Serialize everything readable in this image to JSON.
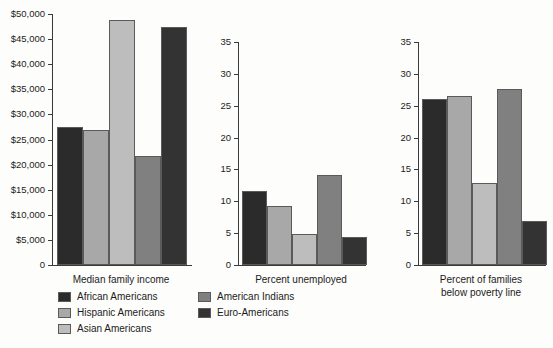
{
  "chart_data": {
    "type": "bar",
    "title": "",
    "grid": false,
    "legend_position": "bottom-left",
    "categories": [
      "African Americans",
      "Hispanic Americans",
      "Asian Americans",
      "American Indians",
      "Euro-Americans"
    ],
    "series_colors": [
      "#2b2b2b",
      "#a8a8a8",
      "#bdbdbd",
      "#808080",
      "#333333"
    ],
    "panels": [
      {
        "id": "median-family-income",
        "xlabel": "Median family income",
        "ylabel": "",
        "ylim": [
          0,
          50000
        ],
        "ytick_values": [
          0,
          5000,
          10000,
          15000,
          20000,
          25000,
          30000,
          35000,
          40000,
          45000,
          50000
        ],
        "ytick_labels": [
          "0",
          "$5,000",
          "$10,000",
          "$15,000",
          "$20,000",
          "$25,000",
          "$30,000",
          "$35,000",
          "$40,000",
          "$45,000",
          "$50,000"
        ],
        "values": [
          27500,
          26800,
          48900,
          21700,
          47400
        ]
      },
      {
        "id": "percent-unemployed",
        "xlabel": "Percent unemployed",
        "ylabel": "",
        "ylim": [
          0,
          35
        ],
        "ytick_values": [
          0,
          5,
          10,
          15,
          20,
          25,
          30,
          35
        ],
        "ytick_labels": [
          "0",
          "5",
          "10",
          "15",
          "20",
          "25",
          "30",
          "35"
        ],
        "values": [
          11.6,
          9.3,
          4.8,
          14.2,
          4.4
        ]
      },
      {
        "id": "percent-families-below-poverty-line",
        "xlabel": "Percent of families\nbelow poverty line",
        "xlabel_line1": "Percent of families",
        "xlabel_line2": "below poverty line",
        "ylabel": "",
        "ylim": [
          0,
          35
        ],
        "ytick_values": [
          0,
          5,
          10,
          15,
          20,
          25,
          30,
          35
        ],
        "ytick_labels": [
          "0",
          "5",
          "10",
          "15",
          "20",
          "25",
          "30",
          "35"
        ],
        "values": [
          26.1,
          26.5,
          12.8,
          27.7,
          6.9
        ]
      }
    ]
  },
  "legend": {
    "items": [
      {
        "label": "African Americans",
        "color": "#2b2b2b"
      },
      {
        "label": "Hispanic Americans",
        "color": "#a8a8a8"
      },
      {
        "label": "Asian Americans",
        "color": "#bdbdbd"
      },
      {
        "label": "American Indians",
        "color": "#808080"
      },
      {
        "label": "Euro-Americans",
        "color": "#333333"
      }
    ]
  }
}
